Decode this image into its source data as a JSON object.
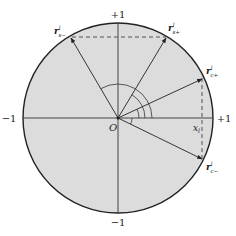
{
  "diagram": {
    "type": "unit-circle",
    "colors": {
      "fill": "#dcdcdc",
      "stroke": "#222222",
      "background": "#ffffff"
    },
    "axis_labels": {
      "top": "+1",
      "bottom": "−1",
      "left": "−1",
      "right": "+1",
      "origin": "O",
      "x_marker": "x",
      "x_marker_sub": "l"
    },
    "vectors": [
      {
        "id": "r_s_minus",
        "base": "r",
        "sup": "l",
        "sub": "s−"
      },
      {
        "id": "r_s_plus",
        "base": "r",
        "sup": "l",
        "sub": "s+"
      },
      {
        "id": "r_c_plus",
        "base": "r",
        "sup": "l",
        "sub": "c+"
      },
      {
        "id": "r_c_minus",
        "base": "r",
        "sup": "l",
        "sub": "c−"
      }
    ]
  }
}
